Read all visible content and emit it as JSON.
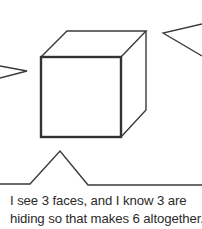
{
  "figure": {
    "cube": {
      "front_face": {
        "x": 41,
        "y": 57,
        "w": 80,
        "h": 80
      },
      "back_offset": {
        "dx": 25,
        "dy": -26
      },
      "stroke_color": "#3a3a3a"
    }
  },
  "caption": {
    "line1": "I see 3 faces, and I know 3 are",
    "line2": "hiding so that makes 6 altogether."
  }
}
